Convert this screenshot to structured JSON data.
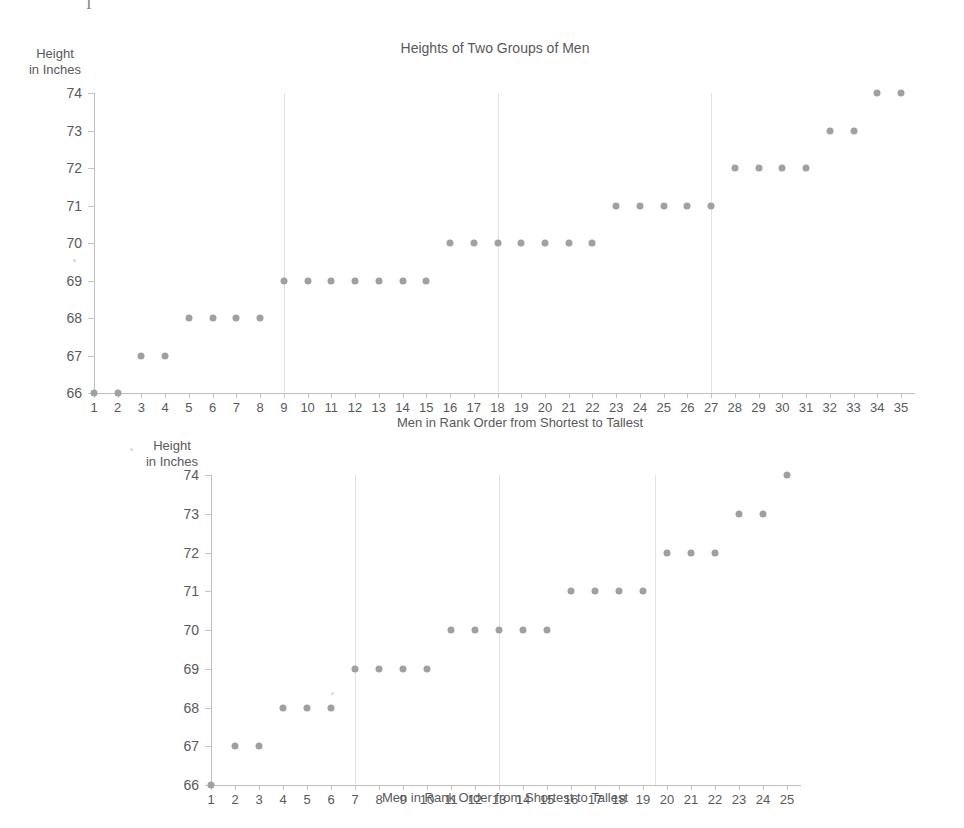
{
  "figure": {
    "title": "Heights of Two Groups of Men",
    "y_axis_label": "Height\nin Inches",
    "x_axis_label": "Men in Rank Order from Shortest to Tallest",
    "dot_color": "#a0a0a0",
    "axis_color": "#bfbfbf",
    "gridline_color": "#e2e2e2",
    "text_color": "#58595b"
  },
  "chart_data": [
    {
      "type": "scatter",
      "title": "Heights of Two Groups of Men",
      "xlabel": "Men in Rank Order from Shortest to Tallest",
      "ylabel": "Height in Inches",
      "xlim": [
        1,
        35
      ],
      "ylim": [
        66,
        74
      ],
      "grid": true,
      "gridlines_x": [
        9,
        18,
        27
      ],
      "yticks": [
        66,
        67,
        68,
        69,
        70,
        71,
        72,
        73,
        74
      ],
      "xticks": [
        1,
        2,
        3,
        4,
        5,
        6,
        7,
        8,
        9,
        10,
        11,
        12,
        13,
        14,
        15,
        16,
        17,
        18,
        19,
        20,
        21,
        22,
        23,
        24,
        25,
        26,
        27,
        28,
        29,
        30,
        31,
        32,
        33,
        34,
        35
      ],
      "x": [
        1,
        2,
        3,
        4,
        5,
        6,
        7,
        8,
        9,
        10,
        11,
        12,
        13,
        14,
        15,
        16,
        17,
        18,
        19,
        20,
        21,
        22,
        23,
        24,
        25,
        26,
        27,
        28,
        29,
        30,
        31,
        32,
        33,
        34,
        35
      ],
      "y": [
        66,
        66,
        67,
        67,
        68,
        68,
        68,
        68,
        69,
        69,
        69,
        69,
        69,
        69,
        69,
        70,
        70,
        70,
        70,
        70,
        70,
        70,
        71,
        71,
        71,
        71,
        71,
        72,
        72,
        72,
        72,
        73,
        73,
        74,
        74
      ],
      "n": 35
    },
    {
      "type": "scatter",
      "title": "",
      "xlabel": "Men in Rank Order from Shortest to Tallest",
      "ylabel": "Height in Inches",
      "xlim": [
        1,
        25
      ],
      "ylim": [
        66,
        74
      ],
      "grid": true,
      "gridlines_x": [
        7,
        13,
        19.5
      ],
      "yticks": [
        66,
        67,
        68,
        69,
        70,
        71,
        72,
        73,
        74
      ],
      "xticks": [
        1,
        2,
        3,
        4,
        5,
        6,
        7,
        8,
        9,
        10,
        11,
        12,
        13,
        14,
        15,
        16,
        17,
        18,
        19,
        20,
        21,
        22,
        23,
        24,
        25
      ],
      "x": [
        1,
        2,
        3,
        4,
        5,
        6,
        7,
        8,
        9,
        10,
        11,
        12,
        13,
        14,
        15,
        16,
        17,
        18,
        19,
        20,
        21,
        22,
        23,
        24,
        25
      ],
      "y": [
        66,
        67,
        67,
        68,
        68,
        68,
        69,
        69,
        69,
        69,
        70,
        70,
        70,
        70,
        70,
        71,
        71,
        71,
        71,
        72,
        72,
        72,
        73,
        73,
        74
      ],
      "n": 25
    }
  ],
  "artifacts": {
    "top_glyph": "I"
  }
}
